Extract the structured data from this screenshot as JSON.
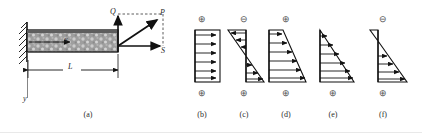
{
  "figure": {
    "caption_labels": [
      "(a)",
      "(b)",
      "(c)",
      "(d)",
      "(e)",
      "(f)"
    ],
    "beam": {
      "panel_label": "(a)",
      "axis_x_label": "x",
      "axis_y_label": "y",
      "length_label": "L",
      "force_vertical_label": "Q",
      "force_horizontal_label": "S",
      "force_resultant_label": "P",
      "support_type": "fixed-hatched-wall",
      "beam_fill": "#9a9a9a",
      "beam_outline": "#111111"
    },
    "sign_symbols": {
      "plus": "⊕",
      "minus": "⊖"
    },
    "diagrams": [
      {
        "label": "(b)",
        "top_sign": "⊕",
        "bottom_sign": "⊕",
        "shape": "rectangle",
        "description": "uniform distribution, arrows pointing right",
        "arrow_count": 6,
        "profile": [
          1,
          1,
          1,
          1,
          1,
          1
        ],
        "zero_at": "none"
      },
      {
        "label": "(c)",
        "top_sign": "⊖",
        "bottom_sign": "⊕",
        "shape": "antisymmetric-bitriangle",
        "description": "linear through zero at mid-height, arrows left above, right below",
        "arrow_count": 6,
        "profile": [
          -1,
          -0.6,
          -0.2,
          0.2,
          0.6,
          1
        ],
        "zero_at": "mid"
      },
      {
        "label": "(d)",
        "top_sign": "⊕",
        "bottom_sign": "⊕",
        "shape": "trapezoid",
        "description": "linear increase from small top value to large bottom value",
        "arrow_count": 6,
        "profile": [
          0.32,
          0.46,
          0.6,
          0.73,
          0.87,
          1
        ],
        "zero_at": "none"
      },
      {
        "label": "(e)",
        "top_sign": "",
        "bottom_sign": "⊕",
        "shape": "triangle",
        "description": "linear increase from zero at top to maximum at bottom",
        "arrow_count": 6,
        "profile": [
          0.06,
          0.25,
          0.44,
          0.63,
          0.81,
          1
        ],
        "zero_at": "top"
      },
      {
        "label": "(f)",
        "top_sign": "⊖",
        "bottom_sign": "⊕",
        "shape": "small-negative-lobe-plus-triangle",
        "description": "small negative wedge at top, larger positive triangle below",
        "arrow_count": 4,
        "profile": [
          -0.22,
          0.3,
          0.53,
          0.76,
          1
        ],
        "zero_at": "upper-third"
      }
    ]
  }
}
